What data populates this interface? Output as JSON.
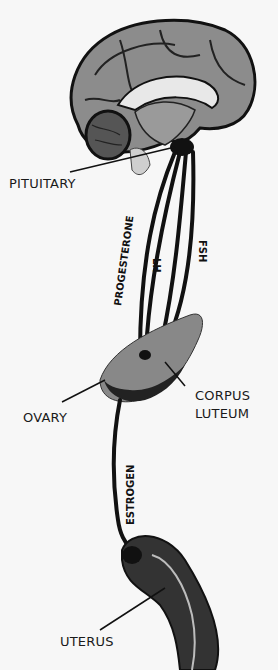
{
  "labels": {
    "pituitary": "PITUITARY",
    "ovary": "OVARY",
    "corpus_luteum_line1": "CORPUS",
    "corpus_luteum_line2": "LUTEUM",
    "uterus": "UTERUS"
  },
  "pathways": {
    "progesterone": "PROGESTERONE",
    "lh": "LH",
    "fsh": "FSH",
    "estrogen": "ESTROGEN"
  },
  "colors": {
    "background": "#f7f7f7",
    "ink": "#111111",
    "brain_gray": "#8a8a8a",
    "organ_dark": "#2a2a2a"
  }
}
